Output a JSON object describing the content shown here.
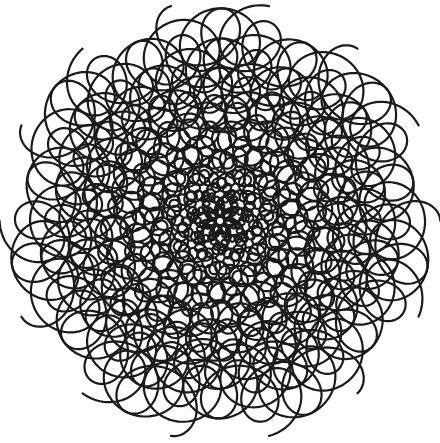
{
  "canvas": {
    "width": 440,
    "height": 443,
    "background": "#ffffff"
  },
  "artwork": {
    "subject": "spiral loop pattern",
    "stroke_color": "#1a1a1a",
    "stroke_width": 2.2,
    "center": [
      220,
      221
    ],
    "arms": 7,
    "outer_radius": 190,
    "inner_radius": 2,
    "loops_per_arm": 38,
    "twist": 2.6,
    "loop_size_ratio": 0.16
  }
}
